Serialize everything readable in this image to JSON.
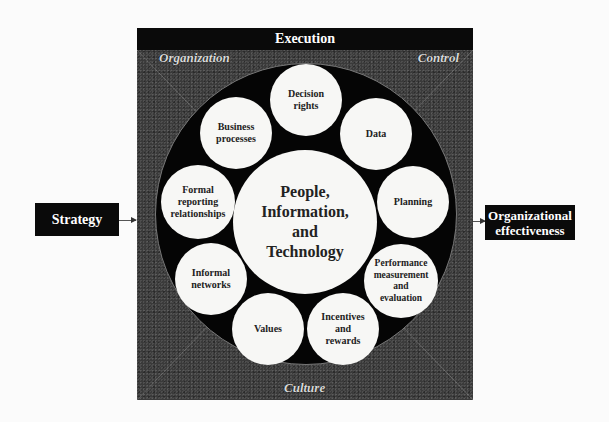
{
  "diagram": {
    "title_bar": "Execution",
    "corners": {
      "top_left": "Organization",
      "top_right": "Control",
      "bottom": "Culture"
    },
    "center": "People,\nInformation,\nand\nTechnology",
    "bubbles": [
      {
        "label": "Decision\nrights"
      },
      {
        "label": "Data"
      },
      {
        "label": "Planning"
      },
      {
        "label": "Performance\nmeasurement\nand\nevaluation"
      },
      {
        "label": "Incentives\nand\nrewards"
      },
      {
        "label": "Values"
      },
      {
        "label": "Informal\nnetworks"
      },
      {
        "label": "Formal\nreporting\nrelationships"
      },
      {
        "label": "Business\nprocesses"
      }
    ],
    "input": "Strategy",
    "output": "Organizational\neffectiveness",
    "colors": {
      "box_fill": "#0a0a0a",
      "bubble_fill": "#f7f7f5",
      "texture": "#3a3a3a"
    }
  }
}
